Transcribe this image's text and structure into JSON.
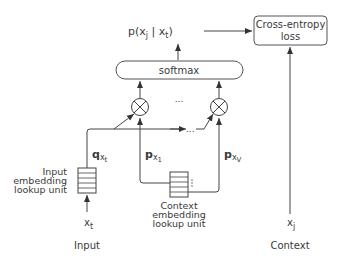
{
  "diagram": {
    "probability_label": "p(x",
    "prob_sub_j": "j",
    "prob_mid": " | x",
    "prob_sub_t": "t",
    "prob_close": ")",
    "loss_box": {
      "line1": "Cross-entropy",
      "line2": "loss"
    },
    "softmax_label": "softmax",
    "ellipsis": "...",
    "q_label": "q",
    "q_sub": "x",
    "q_subsub": "t",
    "p1_label": "p",
    "p1_sub": "x",
    "p1_subsub": "1",
    "pV_label": "p",
    "pV_sub": "x",
    "pV_subsub": "V",
    "input_unit": {
      "line1": "Input",
      "line2": "embedding",
      "line3": "lookup unit"
    },
    "context_unit": {
      "line1": "Context",
      "line2": "embedding",
      "line3": "lookup unit"
    },
    "input_var": "x",
    "input_var_sub": "t",
    "context_var": "x",
    "context_var_sub": "j",
    "input_caption": "Input",
    "context_caption": "Context",
    "multiply_symbol": "otimes",
    "stroke_color": "#444444"
  }
}
